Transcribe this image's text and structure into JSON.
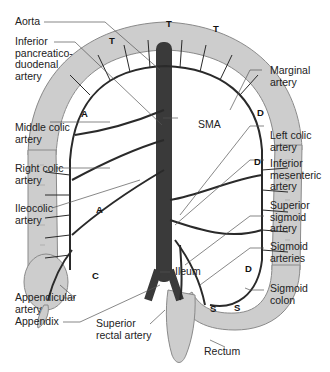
{
  "diagram": {
    "labels": {
      "aorta": "Aorta",
      "ipd": "Inferior\npancreatico-\nduodenal\nartery",
      "marginal": "Marginal\nartery",
      "sma": "SMA",
      "middle_colic": "Middle colic\nartery",
      "left_colic": "Left colic\nartery",
      "right_colic": "Right colic\nartery",
      "ima": "Inferior\nmesenteric\nartery",
      "ileocolic": "Ileocolic\nartery",
      "sup_sigmoid": "Superior\nsigmoid\nartery",
      "ileum": "Ileum",
      "sigmoid_arteries": "Sigmoid\narteries",
      "appendicular": "Appendicular\nartery",
      "sigmoid_colon": "Sigmoid\ncolon",
      "appendix": "Appendix",
      "sup_rectal": "Superior\nrectal artery",
      "rectum": "Rectum"
    },
    "segments": {
      "t1": "T",
      "t2": "T",
      "t3": "T",
      "a1": "A",
      "a2": "A",
      "c": "C",
      "d1": "D",
      "d2": "D",
      "d3": "D",
      "s1": "S",
      "s2": "S"
    },
    "colors": {
      "colon": "#c9c9c9",
      "colon_edge": "#8a8a8a",
      "artery": "#2a2a2a",
      "leader": "#555555"
    }
  }
}
